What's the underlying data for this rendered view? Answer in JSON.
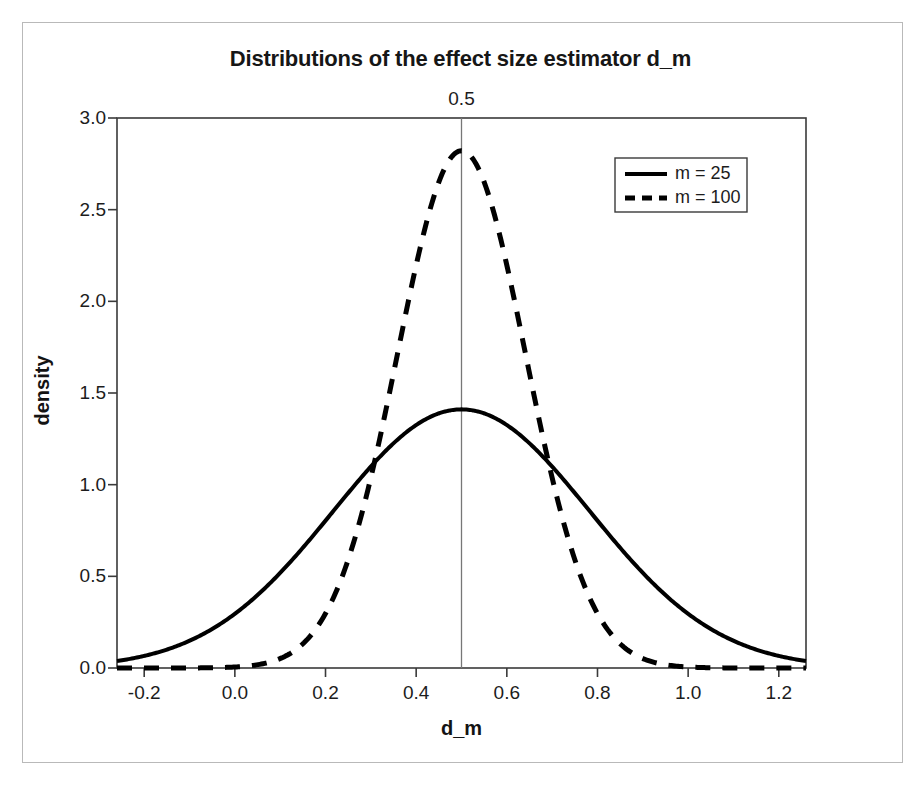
{
  "figure": {
    "has_outer_frame": true,
    "background_color": "#ffffff",
    "frame_color": "#b9b9b9"
  },
  "chart_data": {
    "type": "line",
    "title": "Distributions of the effect size estimator d_m",
    "xlabel": "d_m",
    "ylabel": "density",
    "xlim": [
      -0.26,
      1.26
    ],
    "ylim": [
      0.0,
      3.0
    ],
    "xticks": [
      -0.2,
      0.0,
      0.2,
      0.4,
      0.6,
      0.8,
      1.0,
      1.2
    ],
    "xtick_labels": [
      "-0.2",
      "0.0",
      "0.2",
      "0.4",
      "0.6",
      "0.8",
      "1.0",
      "1.2"
    ],
    "yticks": [
      0.0,
      0.5,
      1.0,
      1.5,
      2.0,
      2.5,
      3.0
    ],
    "ytick_labels": [
      "0.0",
      "0.5",
      "1.0",
      "1.5",
      "2.0",
      "2.5",
      "3.0"
    ],
    "grid": false,
    "legend_position": "upper right",
    "line_color": "#000000",
    "annotations": [
      {
        "name": "true-effect-size-reference-line",
        "type": "vline",
        "x": 0.5,
        "label": "0.5",
        "color": "#777777"
      }
    ],
    "series": [
      {
        "name": "m = 25",
        "style": "solid",
        "distribution": "normal",
        "mean": 0.5,
        "sd": 0.2828,
        "peak_density": 1.41,
        "x": [
          -0.26,
          -0.2,
          -0.1,
          0.0,
          0.1,
          0.2,
          0.3,
          0.4,
          0.5,
          0.6,
          0.7,
          0.8,
          0.9,
          1.0,
          1.1,
          1.2,
          1.26
        ],
        "values": [
          0.04,
          0.07,
          0.15,
          0.27,
          0.45,
          0.69,
          0.97,
          1.24,
          1.41,
          1.24,
          0.97,
          0.69,
          0.45,
          0.27,
          0.15,
          0.07,
          0.04
        ]
      },
      {
        "name": "m = 100",
        "style": "dashed",
        "distribution": "normal",
        "mean": 0.5,
        "sd": 0.1414,
        "peak_density": 2.83,
        "x": [
          -0.26,
          -0.1,
          0.0,
          0.1,
          0.2,
          0.25,
          0.3,
          0.35,
          0.4,
          0.45,
          0.5,
          0.55,
          0.6,
          0.65,
          0.7,
          0.75,
          0.8,
          0.9,
          1.0,
          1.1,
          1.26
        ],
        "values": [
          0.0,
          0.0,
          0.01,
          0.05,
          0.23,
          0.45,
          0.78,
          1.23,
          1.77,
          2.34,
          2.83,
          2.34,
          1.77,
          1.23,
          0.78,
          0.45,
          0.23,
          0.01,
          0.0,
          0.0,
          0.0
        ]
      }
    ]
  },
  "legend": {
    "entries": [
      {
        "label": "m = 25",
        "style": "solid"
      },
      {
        "label": "m = 100",
        "style": "dashed"
      }
    ]
  }
}
